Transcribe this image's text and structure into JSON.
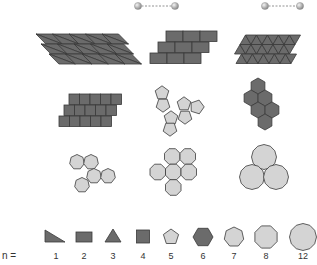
{
  "colors": {
    "dark_fill": "#6b6b6b",
    "light_fill": "#d4d4d4",
    "stroke": "#3a3a3a",
    "ball": "#a8a8a8"
  },
  "legend": {
    "prefix": "n =",
    "items": [
      {
        "n": "1",
        "shape": "right-triangle",
        "fill": "dark",
        "x": 56
      },
      {
        "n": "2",
        "shape": "rectangle",
        "fill": "dark",
        "x": 84
      },
      {
        "n": "3",
        "shape": "triangle",
        "fill": "dark",
        "x": 113
      },
      {
        "n": "4",
        "shape": "square",
        "fill": "dark",
        "x": 143
      },
      {
        "n": "5",
        "shape": "pentagon",
        "fill": "light",
        "x": 171
      },
      {
        "n": "6",
        "shape": "hexagon",
        "fill": "dark",
        "x": 203
      },
      {
        "n": "7",
        "shape": "heptagon",
        "fill": "light",
        "x": 234
      },
      {
        "n": "8",
        "shape": "octagon",
        "fill": "light",
        "x": 266
      },
      {
        "n": "12",
        "shape": "dodecagon",
        "fill": "light",
        "x": 303
      }
    ]
  },
  "dumbbells": [
    {
      "x1": 138,
      "x2": 175,
      "y": 6
    },
    {
      "x1": 265,
      "x2": 300,
      "y": 6
    }
  ],
  "panels": [
    {
      "id": "right-triangle-tiling",
      "row": 1,
      "col": 1,
      "fill": "dark"
    },
    {
      "id": "rectangle-brick-tiling",
      "row": 1,
      "col": 2,
      "fill": "dark"
    },
    {
      "id": "triangle-tiling",
      "row": 1,
      "col": 3,
      "fill": "dark"
    },
    {
      "id": "square-brick-tiling",
      "row": 2,
      "col": 1,
      "fill": "dark"
    },
    {
      "id": "pentagon-cluster",
      "row": 2,
      "col": 2,
      "fill": "light"
    },
    {
      "id": "hexagon-cluster",
      "row": 2,
      "col": 3,
      "fill": "dark"
    },
    {
      "id": "heptagon-cluster",
      "row": 3,
      "col": 1,
      "fill": "light"
    },
    {
      "id": "octagon-cluster",
      "row": 3,
      "col": 2,
      "fill": "light"
    },
    {
      "id": "dodecagon-cluster",
      "row": 3,
      "col": 3,
      "fill": "light"
    }
  ]
}
